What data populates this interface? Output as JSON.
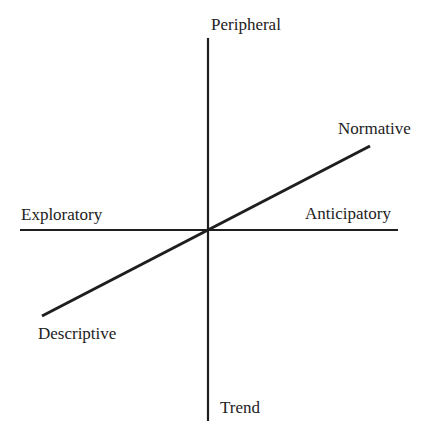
{
  "diagram": {
    "type": "axes-diagram",
    "stroke_color": "#1e1e1e",
    "text_color": "#222222",
    "background": "#ffffff",
    "axes": {
      "vertical": {
        "top_label": "Peripheral",
        "bottom_label": "Trend"
      },
      "horizontal": {
        "left_label": "Exploratory",
        "right_label": "Anticipatory"
      },
      "diagonal": {
        "upper_right_label": "Normative",
        "lower_left_label": "Descriptive"
      }
    },
    "geometry": {
      "vertical_line": {
        "x1": 208,
        "y1": 38,
        "x2": 208,
        "y2": 421
      },
      "horizontal_line": {
        "x1": 20,
        "y1": 230,
        "x2": 398,
        "y2": 230
      },
      "diagonal_line": {
        "x1": 42,
        "y1": 316,
        "x2": 370,
        "y2": 146
      }
    }
  }
}
